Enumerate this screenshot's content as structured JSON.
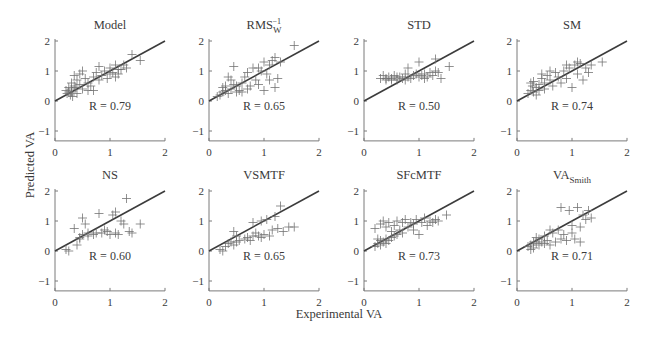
{
  "figure": {
    "xlabel": "Experimental VA",
    "ylabel": "Predicted VA"
  },
  "chart_data": {
    "type": "scatter",
    "layout": "2x4 small multiples",
    "xlabel": "Experimental VA",
    "ylabel": "Predicted VA",
    "xlim": [
      0,
      2
    ],
    "ylim": [
      -1.33,
      2
    ],
    "xticks": [
      0,
      1,
      2
    ],
    "yticks": [
      -1,
      0,
      1,
      2
    ],
    "grid": false,
    "legend": null,
    "reference_line": {
      "type": "identity",
      "from": [
        0,
        0
      ],
      "to": [
        2,
        2
      ]
    },
    "marker": "plus",
    "note": "Point coordinates are approximate placements that reproduce each panel's visual distribution; not exact read-off values.",
    "panels": [
      {
        "title": "Model",
        "title_sub": "",
        "title_sup": "",
        "r_label": "R = 0.79",
        "r": 0.79,
        "points": [
          [
            0.2,
            0.35
          ],
          [
            0.25,
            0.3
          ],
          [
            0.3,
            0.4
          ],
          [
            0.22,
            0.25
          ],
          [
            0.35,
            0.5
          ],
          [
            0.28,
            0.2
          ],
          [
            0.3,
            0.6
          ],
          [
            0.4,
            0.7
          ],
          [
            0.35,
            0.85
          ],
          [
            0.45,
            0.55
          ],
          [
            0.5,
            0.4
          ],
          [
            0.45,
            0.9
          ],
          [
            0.5,
            1.0
          ],
          [
            0.55,
            0.75
          ],
          [
            0.6,
            0.6
          ],
          [
            0.65,
            0.5
          ],
          [
            0.7,
            0.8
          ],
          [
            0.75,
            0.95
          ],
          [
            0.8,
            0.7
          ],
          [
            0.85,
            0.85
          ],
          [
            0.9,
            1.0
          ],
          [
            0.95,
            0.75
          ],
          [
            1.0,
            1.1
          ],
          [
            1.05,
            0.95
          ],
          [
            1.1,
            0.8
          ],
          [
            1.1,
            1.2
          ],
          [
            1.15,
            0.9
          ],
          [
            1.2,
            1.05
          ],
          [
            1.25,
            1.2
          ],
          [
            1.3,
            1.1
          ],
          [
            1.4,
            1.55
          ],
          [
            1.55,
            1.35
          ],
          [
            0.3,
            0.3
          ],
          [
            0.38,
            0.45
          ],
          [
            0.32,
            0.15
          ],
          [
            0.6,
            0.35
          ],
          [
            0.7,
            0.35
          ],
          [
            0.4,
            0.25
          ],
          [
            0.25,
            0.45
          ],
          [
            0.8,
            1.15
          ],
          [
            1.0,
            0.9
          ],
          [
            1.15,
            1.05
          ]
        ]
      },
      {
        "title": "RMS",
        "title_sub": "W",
        "title_sup": "−1",
        "r_label": "R = 0.65",
        "r": 0.65,
        "points": [
          [
            0.15,
            0.15
          ],
          [
            0.2,
            0.2
          ],
          [
            0.25,
            0.3
          ],
          [
            0.3,
            0.35
          ],
          [
            0.35,
            0.25
          ],
          [
            0.3,
            0.5
          ],
          [
            0.4,
            0.4
          ],
          [
            0.45,
            0.55
          ],
          [
            0.4,
            0.7
          ],
          [
            0.5,
            0.5
          ],
          [
            0.55,
            0.35
          ],
          [
            0.6,
            0.6
          ],
          [
            0.65,
            0.8
          ],
          [
            0.7,
            0.4
          ],
          [
            0.75,
            0.5
          ],
          [
            0.8,
            1.1
          ],
          [
            0.85,
            0.7
          ],
          [
            0.9,
            0.55
          ],
          [
            0.95,
            1.0
          ],
          [
            1.0,
            0.35
          ],
          [
            1.05,
            0.9
          ],
          [
            1.1,
            1.2
          ],
          [
            1.1,
            0.7
          ],
          [
            1.15,
            1.35
          ],
          [
            1.2,
            0.45
          ],
          [
            1.2,
            1.45
          ],
          [
            1.25,
            0.75
          ],
          [
            1.3,
            1.3
          ],
          [
            1.55,
            1.85
          ],
          [
            0.45,
            1.15
          ],
          [
            0.35,
            0.8
          ],
          [
            0.25,
            0.45
          ],
          [
            0.5,
            0.3
          ],
          [
            0.6,
            0.3
          ],
          [
            0.7,
            0.95
          ],
          [
            0.9,
            1.1
          ],
          [
            1.0,
            1.3
          ]
        ]
      },
      {
        "title": "STD",
        "title_sub": "",
        "title_sup": "",
        "r_label": "R = 0.50",
        "r": 0.5,
        "points": [
          [
            0.3,
            0.75
          ],
          [
            0.35,
            0.85
          ],
          [
            0.4,
            0.7
          ],
          [
            0.45,
            0.8
          ],
          [
            0.5,
            0.75
          ],
          [
            0.55,
            0.85
          ],
          [
            0.6,
            0.7
          ],
          [
            0.65,
            0.8
          ],
          [
            0.7,
            0.75
          ],
          [
            0.75,
            0.9
          ],
          [
            0.8,
            0.8
          ],
          [
            0.85,
            0.75
          ],
          [
            0.9,
            0.85
          ],
          [
            0.95,
            0.9
          ],
          [
            1.0,
            0.8
          ],
          [
            1.05,
            0.85
          ],
          [
            1.1,
            0.9
          ],
          [
            1.15,
            0.8
          ],
          [
            1.2,
            0.95
          ],
          [
            1.25,
            0.85
          ],
          [
            1.3,
            1.0
          ],
          [
            1.35,
            0.95
          ],
          [
            1.4,
            0.75
          ],
          [
            1.55,
            1.15
          ],
          [
            1.3,
            1.4
          ],
          [
            1.0,
            1.3
          ],
          [
            0.8,
            1.1
          ],
          [
            0.5,
            0.7
          ],
          [
            0.4,
            0.75
          ],
          [
            0.6,
            0.8
          ],
          [
            0.75,
            0.7
          ],
          [
            1.1,
            0.75
          ]
        ]
      },
      {
        "title": "SM",
        "title_sub": "",
        "title_sup": "",
        "r_label": "R = 0.74",
        "r": 0.74,
        "points": [
          [
            0.2,
            0.25
          ],
          [
            0.25,
            0.35
          ],
          [
            0.3,
            0.3
          ],
          [
            0.28,
            0.5
          ],
          [
            0.35,
            0.45
          ],
          [
            0.3,
            0.65
          ],
          [
            0.4,
            0.55
          ],
          [
            0.45,
            0.75
          ],
          [
            0.5,
            0.6
          ],
          [
            0.5,
            0.4
          ],
          [
            0.55,
            0.85
          ],
          [
            0.6,
            0.7
          ],
          [
            0.65,
            0.5
          ],
          [
            0.7,
            0.95
          ],
          [
            0.75,
            0.8
          ],
          [
            0.8,
            0.6
          ],
          [
            0.85,
            1.0
          ],
          [
            0.9,
            0.75
          ],
          [
            0.95,
            1.1
          ],
          [
            1.0,
            0.45
          ],
          [
            1.05,
            1.2
          ],
          [
            1.1,
            0.9
          ],
          [
            1.15,
            1.25
          ],
          [
            1.2,
            0.7
          ],
          [
            1.25,
            1.1
          ],
          [
            1.3,
            0.95
          ],
          [
            1.35,
            1.2
          ],
          [
            1.55,
            1.3
          ],
          [
            0.35,
            0.2
          ],
          [
            0.4,
            0.35
          ],
          [
            0.45,
            0.9
          ],
          [
            0.25,
            0.6
          ],
          [
            0.6,
            1.0
          ],
          [
            0.9,
            1.2
          ],
          [
            1.1,
            1.3
          ]
        ]
      },
      {
        "title": "NS",
        "title_sub": "",
        "title_sup": "",
        "r_label": "R = 0.60",
        "r": 0.6,
        "points": [
          [
            0.2,
            0.05
          ],
          [
            0.25,
            0.0
          ],
          [
            0.4,
            0.2
          ],
          [
            0.35,
            0.75
          ],
          [
            0.45,
            0.45
          ],
          [
            0.5,
            0.55
          ],
          [
            0.5,
            1.1
          ],
          [
            0.55,
            0.9
          ],
          [
            0.6,
            0.6
          ],
          [
            0.7,
            0.55
          ],
          [
            0.75,
            0.6
          ],
          [
            0.8,
            1.25
          ],
          [
            0.85,
            0.6
          ],
          [
            0.9,
            0.7
          ],
          [
            0.95,
            0.65
          ],
          [
            1.0,
            0.55
          ],
          [
            1.05,
            1.2
          ],
          [
            1.1,
            0.6
          ],
          [
            1.1,
            1.3
          ],
          [
            1.15,
            0.55
          ],
          [
            1.2,
            1.0
          ],
          [
            1.25,
            0.9
          ],
          [
            1.3,
            1.75
          ],
          [
            1.35,
            0.65
          ],
          [
            1.4,
            0.6
          ],
          [
            1.55,
            0.9
          ],
          [
            0.6,
            0.5
          ],
          [
            0.45,
            0.4
          ]
        ]
      },
      {
        "title": "VSMTF",
        "title_sub": "",
        "title_sup": "",
        "r_label": "R = 0.65",
        "r": 0.65,
        "points": [
          [
            0.2,
            0.05
          ],
          [
            0.25,
            0.0
          ],
          [
            0.3,
            0.15
          ],
          [
            0.35,
            0.25
          ],
          [
            0.4,
            0.3
          ],
          [
            0.45,
            0.2
          ],
          [
            0.45,
            0.65
          ],
          [
            0.5,
            0.5
          ],
          [
            0.55,
            0.35
          ],
          [
            0.65,
            0.4
          ],
          [
            0.7,
            0.45
          ],
          [
            0.75,
            0.35
          ],
          [
            0.8,
            0.5
          ],
          [
            0.8,
            0.95
          ],
          [
            0.85,
            0.6
          ],
          [
            0.9,
            0.5
          ],
          [
            0.95,
            0.45
          ],
          [
            1.0,
            0.55
          ],
          [
            1.05,
            1.05
          ],
          [
            1.1,
            0.5
          ],
          [
            1.15,
            0.7
          ],
          [
            1.2,
            1.15
          ],
          [
            1.25,
            0.75
          ],
          [
            1.3,
            1.5
          ],
          [
            1.35,
            0.65
          ],
          [
            1.45,
            0.8
          ],
          [
            1.55,
            0.8
          ],
          [
            0.5,
            0.3
          ],
          [
            0.95,
            1.0
          ]
        ]
      },
      {
        "title": "SFcMTF",
        "title_sub": "",
        "title_sup": "",
        "r_label": "R = 0.73",
        "r": 0.73,
        "points": [
          [
            0.2,
            0.15
          ],
          [
            0.25,
            0.25
          ],
          [
            0.3,
            0.2
          ],
          [
            0.3,
            0.35
          ],
          [
            0.35,
            0.3
          ],
          [
            0.4,
            0.4
          ],
          [
            0.45,
            0.35
          ],
          [
            0.5,
            0.45
          ],
          [
            0.55,
            0.5
          ],
          [
            0.6,
            0.55
          ],
          [
            0.2,
            0.75
          ],
          [
            0.3,
            0.9
          ],
          [
            0.35,
            1.0
          ],
          [
            0.4,
            0.8
          ],
          [
            0.45,
            0.95
          ],
          [
            0.5,
            0.65
          ],
          [
            0.55,
            0.85
          ],
          [
            0.6,
            1.0
          ],
          [
            0.65,
            0.7
          ],
          [
            0.7,
            0.95
          ],
          [
            0.75,
            1.05
          ],
          [
            0.8,
            0.8
          ],
          [
            0.85,
            0.95
          ],
          [
            0.9,
            0.9
          ],
          [
            0.95,
            1.05
          ],
          [
            1.0,
            0.55
          ],
          [
            1.05,
            0.95
          ],
          [
            1.1,
            1.1
          ],
          [
            1.15,
            0.85
          ],
          [
            1.2,
            1.0
          ],
          [
            1.25,
            0.95
          ],
          [
            1.3,
            1.05
          ],
          [
            1.35,
            1.0
          ],
          [
            1.5,
            1.2
          ],
          [
            0.25,
            0.4
          ],
          [
            0.4,
            0.25
          ],
          [
            0.7,
            0.6
          ],
          [
            0.9,
            0.7
          ]
        ]
      },
      {
        "title": "VA",
        "title_sub": "Smith",
        "title_sup": "",
        "r_label": "R = 0.71",
        "r": 0.71,
        "points": [
          [
            0.2,
            0.15
          ],
          [
            0.25,
            0.2
          ],
          [
            0.3,
            0.1
          ],
          [
            0.3,
            0.3
          ],
          [
            0.35,
            0.25
          ],
          [
            0.4,
            0.2
          ],
          [
            0.4,
            0.4
          ],
          [
            0.45,
            0.3
          ],
          [
            0.5,
            0.25
          ],
          [
            0.5,
            0.5
          ],
          [
            0.55,
            0.35
          ],
          [
            0.6,
            0.2
          ],
          [
            0.65,
            0.6
          ],
          [
            0.7,
            0.3
          ],
          [
            0.75,
            0.7
          ],
          [
            0.8,
            0.4
          ],
          [
            0.8,
            1.45
          ],
          [
            0.85,
            0.55
          ],
          [
            0.9,
            0.35
          ],
          [
            0.95,
            1.35
          ],
          [
            1.0,
            0.6
          ],
          [
            1.05,
            0.4
          ],
          [
            1.1,
            1.45
          ],
          [
            1.15,
            0.8
          ],
          [
            1.2,
            1.2
          ],
          [
            1.25,
            1.05
          ],
          [
            1.3,
            1.35
          ],
          [
            1.35,
            1.1
          ],
          [
            0.35,
            0.45
          ],
          [
            0.6,
            0.7
          ],
          [
            1.0,
            0.85
          ],
          [
            1.15,
            0.3
          ],
          [
            0.25,
            0.05
          ]
        ]
      }
    ]
  },
  "style": {
    "marker_color": "#6e6e6e",
    "line_color": "#3c3c3c",
    "axis_color": "#7a7a7a",
    "text_color": "#3a3a3a",
    "background": "#ffffff"
  }
}
